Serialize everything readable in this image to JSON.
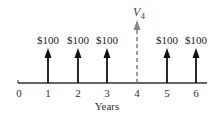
{
  "diagram": {
    "type": "cash-flow-timeline",
    "x_axis_label": "Years",
    "ticks": [
      "0",
      "1",
      "2",
      "3",
      "4",
      "5",
      "6"
    ],
    "cash_flows": [
      {
        "year": 1,
        "label": "$100",
        "style": "solid"
      },
      {
        "year": 2,
        "label": "$100",
        "style": "solid"
      },
      {
        "year": 3,
        "label": "$100",
        "style": "solid"
      },
      {
        "year": 5,
        "label": "$100",
        "style": "solid"
      },
      {
        "year": 6,
        "label": "$100",
        "style": "solid"
      }
    ],
    "valuation_point": {
      "year": 4,
      "label_main": "V",
      "label_sub": "4",
      "style": "dashed"
    },
    "colors": {
      "arrow": "#111111",
      "dashed_arrow": "#777777",
      "axis": "#333333"
    }
  }
}
